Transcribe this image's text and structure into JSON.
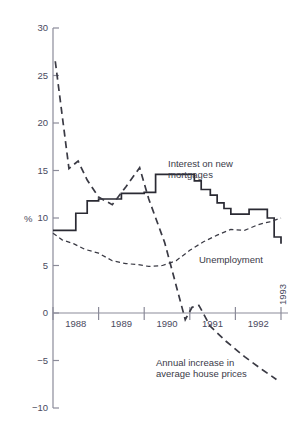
{
  "chart_data": {
    "type": "line",
    "title": "",
    "xlabel": "",
    "ylabel": "%",
    "ylim": [
      -10,
      30
    ],
    "xlim": [
      1988,
      1993
    ],
    "grid": false,
    "legend": "inline-annotations",
    "y_ticks": [
      "30",
      "25",
      "20",
      "15",
      "10",
      "5",
      "0",
      "-5",
      "-10"
    ],
    "y_tick_values": [
      30,
      25,
      20,
      15,
      10,
      5,
      0,
      -5,
      -10
    ],
    "x_ticks": [
      "1988",
      "1989",
      "1990",
      "1991",
      "1992",
      "1993"
    ],
    "x_tick_values": [
      1988,
      1989,
      1990,
      1991,
      1992,
      1993
    ],
    "series": [
      {
        "name": "Interest on new mortgages",
        "style": "solid-step",
        "label_x": 1990.9,
        "label_y": 16.5,
        "x": [
          1988.0,
          1988.25,
          1988.5,
          1988.75,
          1989.0,
          1989.5,
          1989.75,
          1990.0,
          1990.25,
          1990.9,
          1991.1,
          1991.25,
          1991.45,
          1991.6,
          1991.75,
          1991.9,
          1992.1,
          1992.3,
          1992.5,
          1992.7,
          1992.85,
          1993.0
        ],
        "values": [
          8.7,
          8.7,
          10.5,
          11.8,
          12.0,
          12.6,
          12.6,
          12.7,
          14.6,
          14.6,
          13.9,
          13.0,
          12.4,
          11.6,
          11.0,
          10.4,
          10.4,
          10.9,
          10.9,
          10.0,
          8.0,
          7.3
        ]
      },
      {
        "name": "Unemployment",
        "style": "fine-dashed",
        "label_x": 1991.45,
        "label_y": 6.3,
        "x": [
          1988.0,
          1988.2,
          1988.45,
          1988.7,
          1989.0,
          1989.3,
          1989.6,
          1989.85,
          1990.1,
          1990.4,
          1990.7,
          1991.0,
          1991.3,
          1991.6,
          1991.9,
          1992.2,
          1992.5,
          1992.75,
          1993.0
        ],
        "values": [
          8.4,
          7.7,
          7.3,
          6.7,
          6.3,
          5.5,
          5.2,
          5.1,
          4.9,
          5.0,
          5.5,
          6.6,
          7.5,
          8.2,
          8.8,
          8.7,
          9.3,
          9.6,
          10.0
        ]
      },
      {
        "name": "Annual increase in average house prices",
        "style": "bold-dashed",
        "label_x": 1990.55,
        "label_y": -4.6,
        "x": [
          1988.05,
          1988.35,
          1988.55,
          1988.75,
          1989.0,
          1989.3,
          1989.6,
          1989.9,
          1990.1,
          1990.45,
          1990.75,
          1990.9,
          1991.05,
          1991.2,
          1991.45,
          1991.8,
          1992.2,
          1992.6,
          1992.9
        ],
        "values": [
          26.5,
          15.2,
          16.0,
          14.0,
          12.2,
          11.4,
          13.3,
          15.3,
          12.0,
          7.4,
          2.0,
          -0.7,
          0.6,
          0.8,
          -1.4,
          -3.0,
          -4.6,
          -6.0,
          -7.0
        ]
      }
    ],
    "annotations": [
      {
        "text_line1": "Interest on new",
        "text_line2": "mortgages"
      },
      {
        "text_line1": "Unemployment",
        "text_line2": ""
      },
      {
        "text_line1": "Annual increase in",
        "text_line2": "average house prices"
      }
    ]
  },
  "labels": {
    "y_axis_unit": "%",
    "y": {
      "t30": "30",
      "t25": "25",
      "t20": "20",
      "t15": "15",
      "t10": "10",
      "t5": "5",
      "t0": "0",
      "tm5": "-5",
      "tm10": "-10"
    },
    "x": {
      "y1988": "1988",
      "y1989": "1989",
      "y1990": "1990",
      "y1991": "1991",
      "y1992": "1992",
      "y1993": "1993"
    },
    "series_interest_l1": "Interest on new",
    "series_interest_l2": "mortgages",
    "series_unemployment": "Unemployment",
    "series_house_l1": "Annual increase in",
    "series_house_l2": "average house prices"
  },
  "colors": {
    "axis": "#8b8b99",
    "tick_text": "#4a4a5e",
    "series_interest": "#2a2a33",
    "series_unemployment": "#3a3a44",
    "series_house": "#3a3a44",
    "background": "#ffffff"
  }
}
